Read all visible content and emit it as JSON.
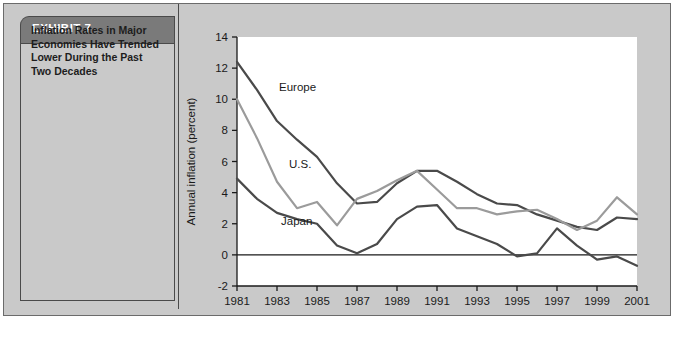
{
  "exhibit": {
    "header_label": "EXHIBIT 7",
    "caption": "Inflation Rates in Major Economies Have Trended Lower During the Past Two Decades"
  },
  "colors": {
    "header_bg": "#7a7a7a",
    "panel_bg": "#c9c9c9",
    "frame_border": "#4a4a4a",
    "plot_bg": "#ffffff",
    "europe": "#4a4a4a",
    "us": "#9b9b9b",
    "japan": "#4a4a4a",
    "axis": "#1a1a1a"
  },
  "chart_data": {
    "type": "line",
    "title": "",
    "xlabel": "",
    "ylabel": "Annual inflation (percent)",
    "xlim": [
      1981,
      2001
    ],
    "ylim": [
      -2,
      14
    ],
    "yticks": [
      -2,
      0,
      2,
      4,
      6,
      8,
      10,
      12,
      14
    ],
    "ytick_labels": [
      "-2",
      "0",
      "2",
      "4",
      "6",
      "8",
      "10",
      "12",
      "14"
    ],
    "xticks": [
      1981,
      1983,
      1985,
      1987,
      1989,
      1991,
      1993,
      1995,
      1997,
      1999,
      2001
    ],
    "xtick_labels": [
      "1981",
      "1983",
      "1985",
      "1987",
      "1989",
      "1991",
      "1993",
      "1995",
      "1997",
      "1999",
      "2001"
    ],
    "grid": false,
    "legend": "inline-labels",
    "zero_line": true,
    "x": [
      1981,
      1982,
      1983,
      1984,
      1985,
      1986,
      1987,
      1988,
      1989,
      1990,
      1991,
      1992,
      1993,
      1994,
      1995,
      1996,
      1997,
      1998,
      1999,
      2000,
      2001
    ],
    "series": [
      {
        "name": "Europe",
        "color": "#4a4a4a",
        "label_x": 1983.1,
        "label_y": 10.5,
        "values": [
          12.4,
          10.6,
          8.6,
          7.4,
          6.3,
          4.6,
          3.3,
          3.4,
          4.6,
          5.4,
          5.4,
          4.7,
          3.9,
          3.3,
          3.2,
          2.6,
          2.2,
          1.8,
          1.6,
          2.4,
          2.3
        ]
      },
      {
        "name": "U.S.",
        "color": "#9b9b9b",
        "label_x": 1983.6,
        "label_y": 5.6,
        "values": [
          10.0,
          7.5,
          4.7,
          3.0,
          3.4,
          1.9,
          3.6,
          4.1,
          4.8,
          5.4,
          4.2,
          3.0,
          3.0,
          2.6,
          2.8,
          2.9,
          2.3,
          1.6,
          2.2,
          3.7,
          2.6
        ]
      },
      {
        "name": "Japan",
        "color": "#4a4a4a",
        "label_x": 1983.2,
        "label_y": 1.9,
        "values": [
          4.9,
          3.6,
          2.7,
          2.3,
          2.0,
          0.6,
          0.1,
          0.7,
          2.3,
          3.1,
          3.2,
          1.7,
          1.2,
          0.7,
          -0.1,
          0.1,
          1.7,
          0.6,
          -0.3,
          -0.1,
          -0.7
        ]
      }
    ]
  }
}
